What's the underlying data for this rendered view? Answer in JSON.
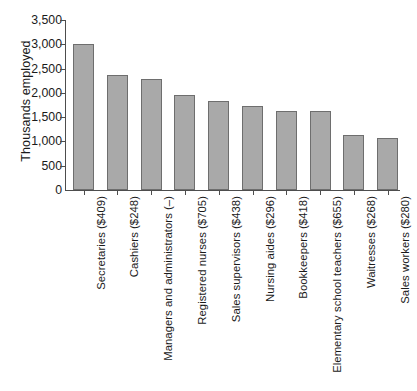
{
  "chart_data": {
    "type": "bar",
    "title": "",
    "xlabel": "",
    "ylabel": "Thousands employed",
    "ylim": [
      0,
      3500
    ],
    "ytick_labels": [
      "3,500",
      "3,000",
      "2,500",
      "2,000",
      "1,500",
      "1,000",
      "500",
      "0"
    ],
    "ytick_values": [
      3500,
      3000,
      2500,
      2000,
      1500,
      1000,
      500,
      0
    ],
    "grid": false,
    "legend": "none",
    "orientation": "vertical",
    "bar_color": "#a9a9a9",
    "bar_edge_color": "#6e6e6e",
    "axis_color": "#4d4d4d",
    "categories": [
      "Secretaries ($409)",
      "Cashiers ($248)",
      "Managers and administrators (–)",
      "Registered nurses ($705)",
      "Sales supervisors ($438)",
      "Nursing aides ($296)",
      "Bookkeepers ($418)",
      "Elementary school teachers ($655)",
      "Waitresses ($268)",
      "Sales workers ($280)"
    ],
    "values": [
      3000,
      2370,
      2280,
      1960,
      1830,
      1730,
      1620,
      1620,
      1130,
      1070
    ]
  }
}
